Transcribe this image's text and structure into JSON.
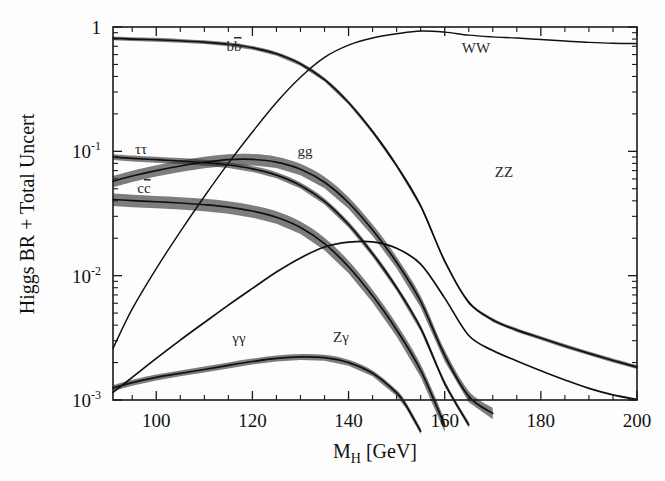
{
  "figure": {
    "background": "#fdfdfd",
    "ink_color": "#101010",
    "band_color": "#2e2e2e"
  },
  "axes": {
    "x_title_main": "M",
    "x_title_sub": "H",
    "x_title_unit": " [GeV]",
    "y_title": "Higgs BR + Total Uncert",
    "x_ticklabels": [
      "100",
      "120",
      "140",
      "160",
      "180",
      "200"
    ],
    "y_ticklabels": [
      "1",
      "10",
      "10",
      "10"
    ],
    "y_tick_exponents": [
      "",
      "-1",
      "-2",
      "-3"
    ]
  },
  "curve_labels": [
    {
      "id": "bb",
      "text": "bb",
      "overbar": true,
      "x": 234,
      "y": 51
    },
    {
      "id": "WW",
      "text": "WW",
      "overbar": false,
      "x": 476,
      "y": 53
    },
    {
      "id": "tautau",
      "text": "ττ",
      "overbar": false,
      "x": 141,
      "y": 154
    },
    {
      "id": "gg",
      "text": "gg",
      "overbar": false,
      "x": 305,
      "y": 156
    },
    {
      "id": "cc",
      "text": "cc",
      "overbar": true,
      "x": 144,
      "y": 193
    },
    {
      "id": "ZZ",
      "text": "ZZ",
      "overbar": false,
      "x": 504,
      "y": 177
    },
    {
      "id": "gamgam",
      "text": "γγ",
      "overbar": false,
      "x": 239,
      "y": 343
    },
    {
      "id": "Zgam",
      "text": "Zγ",
      "overbar": false,
      "x": 341,
      "y": 342
    }
  ],
  "chart_data": {
    "type": "line",
    "title": "",
    "xlabel": "M_H [GeV]",
    "ylabel": "Higgs BR + Total Uncert",
    "xlim": [
      91,
      200
    ],
    "ylim": [
      0.001,
      1
    ],
    "yscale": "log",
    "grid": false,
    "legend": "inline-curve-labels",
    "xticks": [
      100,
      120,
      140,
      160,
      180,
      200
    ],
    "xticks_minor_step": 5,
    "yticks": [
      1,
      0.1,
      0.01,
      0.001
    ],
    "series": [
      {
        "name": "bb",
        "band": true,
        "x": [
          91,
          95,
          100,
          105,
          110,
          115,
          120,
          125,
          130,
          135,
          140,
          145,
          150,
          155,
          160,
          165,
          170,
          175,
          180,
          185,
          190,
          195,
          200
        ],
        "values": [
          0.812,
          0.8,
          0.79,
          0.775,
          0.755,
          0.727,
          0.681,
          0.609,
          0.505,
          0.377,
          0.247,
          0.144,
          0.0768,
          0.0364,
          0.0131,
          0.0061,
          0.0044,
          0.00365,
          0.00315,
          0.00272,
          0.00237,
          0.00208,
          0.00184
        ],
        "rel_unc": 0.035
      },
      {
        "name": "WW",
        "band": false,
        "x": [
          91,
          95,
          100,
          105,
          110,
          115,
          120,
          125,
          130,
          135,
          140,
          145,
          150,
          155,
          160,
          165,
          170,
          175,
          180,
          185,
          190,
          195,
          200
        ],
        "values": [
          0.0026,
          0.0054,
          0.0114,
          0.0226,
          0.0433,
          0.0803,
          0.143,
          0.247,
          0.394,
          0.569,
          0.714,
          0.815,
          0.881,
          0.929,
          0.909,
          0.86,
          0.833,
          0.815,
          0.793,
          0.772,
          0.752,
          0.739,
          0.735
        ]
      },
      {
        "name": "ZZ",
        "band": false,
        "x": [
          91,
          95,
          100,
          105,
          110,
          115,
          120,
          125,
          130,
          135,
          140,
          145,
          150,
          155,
          160,
          162,
          165,
          170,
          175,
          180,
          185,
          190,
          195,
          200
        ],
        "values": [
          0.00027,
          0.000565,
          0.00115,
          0.00224,
          0.0042,
          0.00755,
          0.013,
          0.0212,
          0.0318,
          0.0427,
          0.0502,
          0.0519,
          0.0467,
          0.0338,
          0.0206,
          0.0183,
          0.0215,
          0.0452,
          0.0768,
          0.113,
          0.148,
          0.18,
          0.207,
          0.225
        ]
      },
      {
        "name": "tautau",
        "band": true,
        "x": [
          91,
          95,
          100,
          105,
          110,
          115,
          120,
          125,
          130,
          135,
          140,
          145,
          150,
          155,
          160,
          165,
          170,
          175,
          180,
          185,
          190,
          195,
          200
        ],
        "values": [
          0.09,
          0.0878,
          0.0857,
          0.0836,
          0.081,
          0.0776,
          0.0723,
          0.0644,
          0.0532,
          0.0396,
          0.0258,
          0.015,
          0.00799,
          0.00378,
          0.00136,
          0.000632,
          0.000456,
          0.000378,
          0.000326,
          0.000281,
          0.000245,
          0.000215,
          0.00019
        ],
        "rel_unc": 0.055
      },
      {
        "name": "gg",
        "band": true,
        "x": [
          91,
          95,
          100,
          105,
          110,
          115,
          120,
          125,
          130,
          135,
          140,
          145,
          150,
          155,
          160,
          165,
          170,
          175,
          180,
          185,
          190,
          195,
          200
        ],
        "values": [
          0.0575,
          0.0633,
          0.07,
          0.0762,
          0.0817,
          0.0857,
          0.0861,
          0.0819,
          0.0718,
          0.0564,
          0.0386,
          0.0233,
          0.0128,
          0.00621,
          0.00228,
          0.00107,
          0.000781,
          0.000654,
          0.00057,
          0.000497,
          0.000439,
          0.000391,
          0.00035
        ],
        "rel_unc": 0.105
      },
      {
        "name": "cc",
        "band": true,
        "x": [
          91,
          95,
          100,
          105,
          110,
          115,
          120,
          125,
          130,
          135,
          140,
          145,
          150,
          155,
          160,
          165,
          170,
          175,
          180,
          185,
          190,
          195,
          200
        ],
        "values": [
          0.041,
          0.0402,
          0.0393,
          0.0384,
          0.0372,
          0.0356,
          0.0331,
          0.0295,
          0.0244,
          0.0181,
          0.0118,
          0.00688,
          0.00366,
          0.00173,
          0.000624,
          0.00029,
          0.000209,
          0.000174,
          0.00015,
          0.000129,
          0.000113,
          9.9e-05,
          8.75e-05
        ],
        "rel_unc": 0.115
      },
      {
        "name": "gammagamma",
        "band": true,
        "x": [
          91,
          95,
          100,
          105,
          110,
          115,
          120,
          125,
          130,
          135,
          140,
          145,
          150,
          152,
          155,
          158,
          160
        ],
        "values": [
          0.00125,
          0.00138,
          0.00152,
          0.00164,
          0.00176,
          0.0019,
          0.00204,
          0.00216,
          0.00222,
          0.00219,
          0.002,
          0.00164,
          0.00114,
          0.0009,
          0.00056,
          0.00025,
          0.0001
        ],
        "rel_unc": 0.055
      },
      {
        "name": "Zgamma",
        "band": true,
        "x": [
          113,
          115,
          118,
          120,
          123,
          125,
          128,
          130,
          133,
          135,
          138,
          140,
          143,
          145,
          148,
          150,
          153,
          155,
          157
        ],
        "values": [
          0.0003,
          0.00042,
          0.00066,
          0.00088,
          0.00122,
          0.00145,
          0.00178,
          0.00197,
          0.00218,
          0.00227,
          0.00231,
          0.00226,
          0.00209,
          0.00191,
          0.00157,
          0.00131,
          0.00093,
          0.00069,
          0.00045
        ],
        "rel_unc": 0.06
      },
      {
        "name": "tt-like-rise",
        "band": true,
        "x": [
          91,
          95,
          100,
          105,
          110,
          115,
          120,
          125,
          130,
          135,
          140,
          145,
          150,
          155,
          160,
          165,
          170,
          175,
          180,
          185,
          190,
          195,
          200
        ],
        "values": [
          0.00115,
          0.00152,
          0.00216,
          0.00303,
          0.0042,
          0.0058,
          0.0079,
          0.0107,
          0.0139,
          0.017,
          0.0186,
          0.0187,
          0.0166,
          0.0124,
          0.0066,
          0.0033,
          0.0025,
          0.00206,
          0.00172,
          0.00145,
          0.00124,
          0.0011,
          0.00101
        ]
      }
    ]
  }
}
